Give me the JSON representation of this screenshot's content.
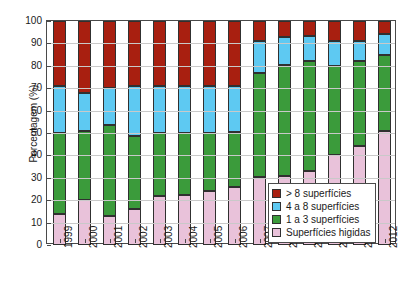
{
  "chart_data": {
    "type": "bar",
    "subtype": "stacked-bar-100-percent",
    "title": "",
    "xlabel": "",
    "ylabel": "Porcentagem (%)",
    "ylim": [
      0,
      100
    ],
    "yticks": [
      0,
      10,
      20,
      30,
      40,
      50,
      60,
      70,
      80,
      90,
      100
    ],
    "grid": true,
    "legend_position": "bottom-right",
    "categories": [
      "1999",
      "2000",
      "2001",
      "2002",
      "2003",
      "2004",
      "2005",
      "2006",
      "2007",
      "2008",
      "2009",
      "2010",
      "2011",
      "2012"
    ],
    "series": [
      {
        "name": "Superfícies higidas",
        "color": "#e9c2da",
        "values": [
          14,
          20,
          13,
          16,
          22,
          22.5,
          24,
          26,
          30.5,
          31,
          33,
          40,
          44,
          51
        ]
      },
      {
        "name": "1 a 3 superfícies",
        "color": "#3b9b3b",
        "values": [
          36,
          31,
          40.5,
          32.5,
          28,
          27.5,
          26,
          24.5,
          46.5,
          49.5,
          49,
          40,
          38,
          34
        ]
      },
      {
        "name": "4 a 8 superfícies",
        "color": "#5ec9f2",
        "values": [
          21,
          17,
          16.5,
          22.5,
          21,
          21,
          21,
          20.5,
          14,
          12.5,
          11.5,
          11,
          9,
          9
        ]
      },
      {
        "name": "> 8 superfícies",
        "color": "#a81f10",
        "values": [
          29,
          32,
          30,
          29,
          29,
          29,
          29,
          29,
          9,
          7,
          6.5,
          9,
          9,
          6
        ]
      }
    ],
    "cumulative_tops": {
      "1999": [
        14,
        50,
        71,
        100
      ],
      "2000": [
        20,
        51,
        68,
        100
      ],
      "2001": [
        13,
        53.5,
        70,
        100
      ],
      "2002": [
        16,
        48.5,
        71,
        100
      ],
      "2003": [
        22,
        50,
        71,
        100
      ],
      "2004": [
        22.5,
        50,
        71,
        100
      ],
      "2005": [
        24,
        50,
        71,
        100
      ],
      "2006": [
        26,
        50.5,
        71,
        100
      ],
      "2007": [
        30.5,
        77,
        91,
        100
      ],
      "2008": [
        31,
        80.5,
        93,
        100
      ],
      "2009": [
        33,
        82,
        93.5,
        100
      ],
      "2010": [
        40,
        80,
        91,
        100
      ],
      "2011": [
        44,
        82,
        91,
        100
      ],
      "2012": [
        51,
        85,
        94,
        100
      ]
    }
  },
  "legend": {
    "items": [
      {
        "label": "> 8 superfícies",
        "color": "#a81f10"
      },
      {
        "label": "4 a 8 superfícies",
        "color": "#5ec9f2"
      },
      {
        "label": "1 a 3 superfícies",
        "color": "#3b9b3b"
      },
      {
        "label": "Superfícies higidas",
        "color": "#e9c2da"
      }
    ]
  },
  "axis": {
    "y_title": "Porcentagem (%)",
    "y_tick_labels": [
      "0",
      "10",
      "20",
      "30",
      "40",
      "50",
      "60",
      "70",
      "80",
      "90",
      "100"
    ],
    "x_tick_labels": [
      "1999",
      "2000",
      "2001",
      "2002",
      "2003",
      "2004",
      "2005",
      "2006",
      "2007",
      "2008",
      "2009",
      "2010",
      "2011",
      "2012"
    ]
  }
}
